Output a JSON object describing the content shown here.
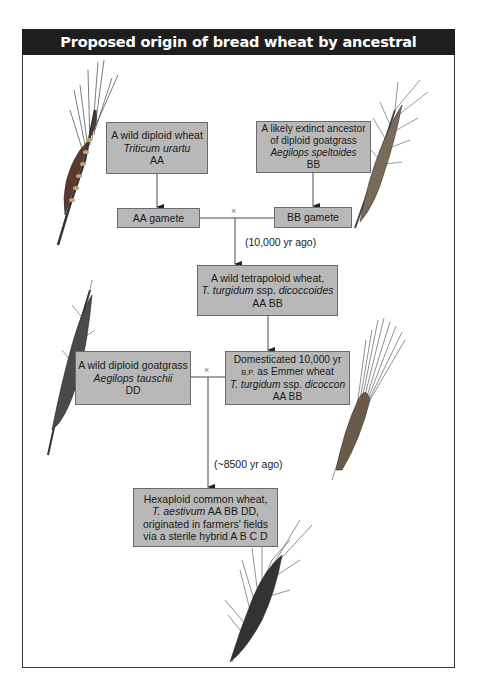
{
  "title": "Proposed origin of bread wheat by ancestral amphidiploidy",
  "boxes": {
    "urartu": {
      "line1": "A wild diploid wheat",
      "species": "Triticum urartu",
      "genome": "AA"
    },
    "speltoides": {
      "line1": "A likely extinct ancestor",
      "line2": "of diploid goatgrass",
      "species": "Aegilops speltoides",
      "genome": "BB"
    },
    "aa_gamete": {
      "label": "AA gamete"
    },
    "bb_gamete": {
      "label": "BB gamete"
    },
    "dicoccoides": {
      "line1": "A wild tetrapoloid wheat,",
      "species_a": "T. turgidum",
      "ssp": " ssp. ",
      "species_b": "dicoccoides",
      "genome": "AA BB"
    },
    "tauschii": {
      "line1": "A wild diploid goatgrass",
      "species": "Aegilops tauschii",
      "genome": "DD"
    },
    "dicoccon": {
      "line1": "Domesticated 10,000 yr",
      "bp": "B.P.",
      "line2": " as Emmer wheat",
      "species_a": "T. turgidum",
      "ssp": " ssp. ",
      "species_b": "dicoccon",
      "genome": "AA BB"
    },
    "aestivum": {
      "line1": "Hexaploid common wheat,",
      "species": "T. aestivum",
      "genome": " AA BB DD,",
      "line3": "originated in farmers' fields",
      "line4": "via a sterile hybrid A B C D"
    }
  },
  "labels": {
    "time1": "(10,000 yr ago)",
    "time2": "(~8500 yr ago)",
    "cross_symbol": "×"
  },
  "colors": {
    "header_bg": "#1e1e1e",
    "box_fill": "#b8b8b8",
    "line": "#333333"
  }
}
